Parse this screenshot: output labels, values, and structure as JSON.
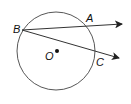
{
  "diagram": {
    "type": "circle-geometry",
    "circle": {
      "center_label": "O",
      "cx": 56,
      "cy": 51,
      "r": 39
    },
    "points": {
      "B": {
        "label": "B",
        "x": 22,
        "y": 31
      },
      "A": {
        "label": "A",
        "x": 91,
        "y": 27
      },
      "C": {
        "label": "C",
        "x": 94,
        "y": 53
      },
      "O": {
        "label": "O",
        "x": 57,
        "y": 51
      }
    },
    "rays": [
      {
        "name": "ray-BA",
        "from": "B",
        "through": "A"
      },
      {
        "name": "ray-BC",
        "from": "B",
        "through": "C"
      }
    ],
    "colors": {
      "stroke": "#222222",
      "background": "#ffffff"
    }
  }
}
